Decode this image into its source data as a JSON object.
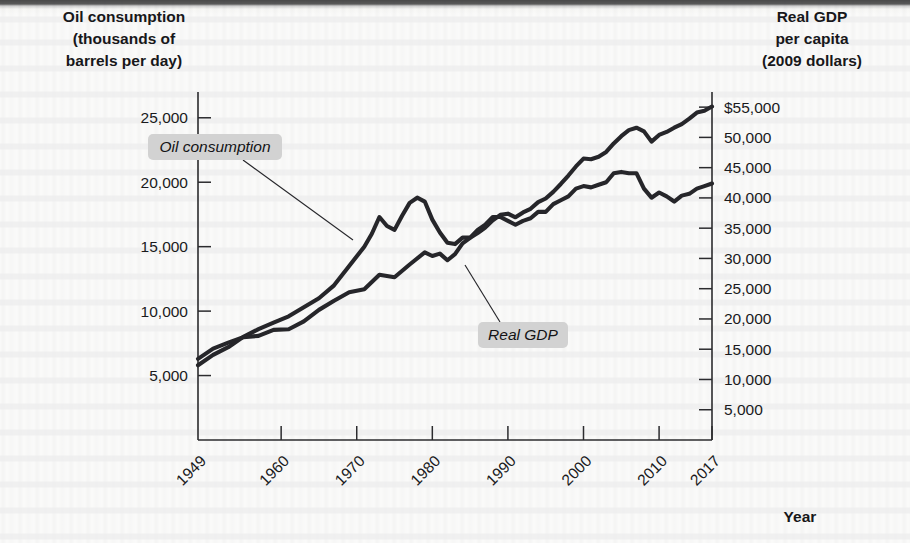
{
  "figure": {
    "left_axis_title": "Oil consumption\n(thousands of\nbarrels per day)",
    "left_axis_title_lines": [
      "Oil consumption",
      "(thousands of",
      "barrels per day)"
    ],
    "right_axis_title_lines": [
      "Real GDP",
      "per capita",
      "(2009 dollars)"
    ],
    "x_axis_name": "Year",
    "callouts": [
      {
        "name": "oil-consumption-callout",
        "label": "Oil consumption"
      },
      {
        "name": "real-gdp-callout",
        "label": "Real GDP"
      }
    ]
  },
  "chart_data": {
    "type": "line",
    "title": "",
    "subtitle": "",
    "xlabel": "Year",
    "ylabel": "Oil consumption (thousands of barrels per day)",
    "y2label": "Real GDP per capita (2009 dollars)",
    "grid": false,
    "legend_position": "inline-annotations",
    "x_tick_labels": [
      "1949",
      "1960",
      "1970",
      "1980",
      "1990",
      "2000",
      "2010",
      "2017"
    ],
    "x_tick_values": [
      1949,
      1960,
      1970,
      1980,
      1990,
      2000,
      2010,
      2017
    ],
    "xlim": [
      1949,
      2017
    ],
    "ylim": [
      0,
      27000
    ],
    "y_tick_labels": [
      "25,000",
      "20,000",
      "15,000",
      "10,000",
      "5,000"
    ],
    "y_tick_values": [
      25000,
      20000,
      15000,
      10000,
      5000
    ],
    "y2lim": [
      0,
      57500
    ],
    "y2_tick_labels": [
      "$55,000",
      "50,000",
      "45,000",
      "40,000",
      "35,000",
      "30,000",
      "25,000",
      "20,000",
      "15,000",
      "10,000",
      "5,000"
    ],
    "y2_tick_values": [
      55000,
      50000,
      45000,
      40000,
      35000,
      30000,
      25000,
      20000,
      15000,
      10000,
      5000
    ],
    "series": [
      {
        "name": "Oil consumption",
        "axis": "left",
        "unit": "thousands of barrels per day",
        "color": "#26262a",
        "x": [
          1949,
          1951,
          1953,
          1955,
          1957,
          1959,
          1961,
          1963,
          1965,
          1967,
          1969,
          1971,
          1972,
          1973,
          1974,
          1975,
          1976,
          1977,
          1978,
          1979,
          1980,
          1981,
          1982,
          1983,
          1984,
          1985,
          1986,
          1987,
          1988,
          1989,
          1990,
          1991,
          1992,
          1993,
          1994,
          1995,
          1996,
          1997,
          1998,
          1999,
          2000,
          2001,
          2002,
          2003,
          2004,
          2005,
          2006,
          2007,
          2008,
          2009,
          2010,
          2011,
          2012,
          2013,
          2014,
          2015,
          2016,
          2017
        ],
        "values": [
          5800,
          6600,
          7200,
          8000,
          8600,
          9100,
          9600,
          10300,
          11000,
          12000,
          13500,
          15000,
          16000,
          17300,
          16600,
          16300,
          17400,
          18400,
          18800,
          18500,
          17100,
          16100,
          15300,
          15200,
          15700,
          15700,
          16300,
          16700,
          17300,
          17300,
          17000,
          16700,
          17000,
          17200,
          17700,
          17700,
          18300,
          18600,
          18900,
          19500,
          19700,
          19600,
          19800,
          20000,
          20700,
          20800,
          20700,
          20700,
          19500,
          18800,
          19200,
          18900,
          18500,
          18960,
          19100,
          19500,
          19700,
          19900
        ]
      },
      {
        "name": "Real GDP",
        "axis": "right",
        "unit": "2009 dollars per capita",
        "color": "#26262a",
        "x": [
          1949,
          1951,
          1953,
          1955,
          1957,
          1959,
          1961,
          1963,
          1965,
          1967,
          1969,
          1971,
          1973,
          1975,
          1977,
          1979,
          1980,
          1981,
          1982,
          1983,
          1984,
          1985,
          1986,
          1987,
          1988,
          1989,
          1990,
          1991,
          1992,
          1993,
          1994,
          1995,
          1996,
          1997,
          1998,
          1999,
          2000,
          2001,
          2002,
          2003,
          2004,
          2005,
          2006,
          2007,
          2008,
          2009,
          2010,
          2011,
          2012,
          2013,
          2014,
          2015,
          2016,
          2017
        ],
        "values": [
          13400,
          15100,
          16100,
          17000,
          17200,
          18200,
          18300,
          19600,
          21500,
          23000,
          24400,
          24900,
          27300,
          26900,
          29000,
          31000,
          30400,
          30800,
          29700,
          30700,
          32500,
          33400,
          34200,
          35100,
          36300,
          37200,
          37400,
          36800,
          37600,
          38200,
          39300,
          39900,
          41000,
          42300,
          43700,
          45200,
          46500,
          46400,
          46800,
          47600,
          49000,
          50200,
          51200,
          51600,
          51000,
          49300,
          50400,
          50900,
          51600,
          52200,
          53100,
          54100,
          54400,
          55100
        ]
      }
    ]
  },
  "geometry": {
    "plot_left": 198,
    "plot_right": 712,
    "plot_top": 92,
    "plot_bottom": 440
  }
}
